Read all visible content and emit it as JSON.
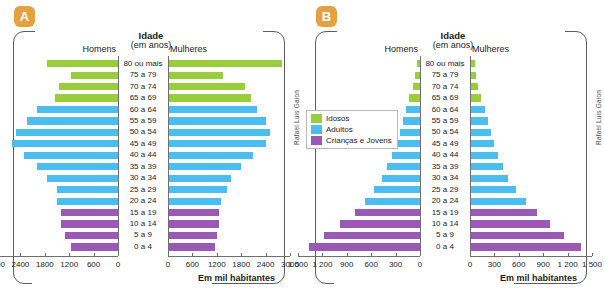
{
  "panels": [
    {
      "badge": "A",
      "title": "Idade",
      "subtitle": "(em anos)",
      "left_header": "Homens",
      "right_header": "Mulheres",
      "axis_caption": "Em mil habitantes",
      "credit": "Rafael Luis Gaion"
    },
    {
      "badge": "B",
      "title": "Idade",
      "subtitle": "(em anos)",
      "left_header": "Homens",
      "right_header": "Mulheres",
      "axis_caption": "Em mil habitantes",
      "credit": "Rafael Luis Gaion"
    }
  ],
  "legend": {
    "items": [
      {
        "label": "Idosos",
        "color": "#9ACD3C"
      },
      {
        "label": "Adultos",
        "color": "#4BBDEF"
      },
      {
        "label": "Crianças e Jovens",
        "color": "#9B59B6"
      }
    ]
  },
  "colors": {
    "idosos": "#9ACD3C",
    "adultos": "#4BBDEF",
    "criancas": "#9B59B6",
    "badge": "#E3A23F",
    "frame": "#5c5c5c",
    "axis": "#6f6f6f"
  },
  "chart_data": [
    {
      "type": "bar",
      "subtype": "population-pyramid",
      "panel": "A",
      "title": "Idade (em anos)",
      "xlabel": "Em mil habitantes",
      "ylabel": "Idade (em anos)",
      "left_series_name": "Homens",
      "right_series_name": "Mulheres",
      "xlim": [
        0,
        3000
      ],
      "xticks": [
        0,
        600,
        1200,
        1800,
        2400,
        3000
      ],
      "xtick_labels_left": [
        "3000",
        "2400",
        "1800",
        "1200",
        "600",
        "0"
      ],
      "xtick_labels_right": [
        "0",
        "600",
        "1200",
        "1800",
        "2400",
        "3000"
      ],
      "grid": false,
      "categories": [
        "80 ou mais",
        "75 a 79",
        "70 a 74",
        "65 a 69",
        "60 a 64",
        "55 a 59",
        "50 a 54",
        "45 a 49",
        "40 a 44",
        "35 a 39",
        "30 a 34",
        "25 a 29",
        "20 a 24",
        "15 a 19",
        "10 a 14",
        "5 a 9",
        "0 a 4"
      ],
      "groups": [
        "Idosos",
        "Idosos",
        "Idosos",
        "Idosos",
        "Adultos",
        "Adultos",
        "Adultos",
        "Adultos",
        "Adultos",
        "Adultos",
        "Adultos",
        "Adultos",
        "Adultos",
        "Crianças e Jovens",
        "Crianças e Jovens",
        "Crianças e Jovens",
        "Crianças e Jovens"
      ],
      "series": [
        {
          "name": "Homens",
          "values": [
            1750,
            1150,
            1450,
            1550,
            2000,
            2250,
            2500,
            2600,
            2300,
            2000,
            1750,
            1500,
            1500,
            1400,
            1400,
            1300,
            1150
          ]
        },
        {
          "name": "Mulheres",
          "values": [
            2800,
            1350,
            1900,
            2050,
            2200,
            2400,
            2500,
            2400,
            2100,
            1800,
            1550,
            1450,
            1300,
            1250,
            1250,
            1200,
            1150
          ]
        }
      ]
    },
    {
      "type": "bar",
      "subtype": "population-pyramid",
      "panel": "B",
      "title": "Idade (em anos)",
      "xlabel": "Em mil habitantes",
      "ylabel": "Idade (em anos)",
      "left_series_name": "Homens",
      "right_series_name": "Mulheres",
      "xlim": [
        0,
        1500
      ],
      "xticks": [
        0,
        300,
        600,
        900,
        1200,
        1500
      ],
      "xtick_labels_left": [
        "1 500",
        "1 200",
        "900",
        "600",
        "300",
        "0"
      ],
      "xtick_labels_right": [
        "0",
        "300",
        "600",
        "900",
        "1 200",
        "1 500"
      ],
      "grid": false,
      "categories": [
        "80 ou mais",
        "75 a 79",
        "70 a 74",
        "65 a 69",
        "60 a 64",
        "55 a 59",
        "50 a 54",
        "45 a 49",
        "40 a 44",
        "35 a 39",
        "30 a 34",
        "25 a 29",
        "20 a 24",
        "15 a 19",
        "10 a 14",
        "5 a 9",
        "0 a 4"
      ],
      "groups": [
        "Idosos",
        "Idosos",
        "Idosos",
        "Idosos",
        "Adultos",
        "Adultos",
        "Adultos",
        "Adultos",
        "Adultos",
        "Adultos",
        "Adultos",
        "Adultos",
        "Adultos",
        "Crianças e Jovens",
        "Crianças e Jovens",
        "Crianças e Jovens",
        "Crianças e Jovens"
      ],
      "series": [
        {
          "name": "Homens",
          "values": [
            40,
            60,
            90,
            130,
            170,
            210,
            250,
            300,
            350,
            410,
            470,
            560,
            680,
            800,
            980,
            1180,
            1370
          ]
        },
        {
          "name": "Mulheres",
          "values": [
            60,
            70,
            100,
            140,
            180,
            220,
            260,
            300,
            350,
            400,
            470,
            570,
            690,
            820,
            980,
            1160,
            1360
          ]
        }
      ]
    }
  ]
}
